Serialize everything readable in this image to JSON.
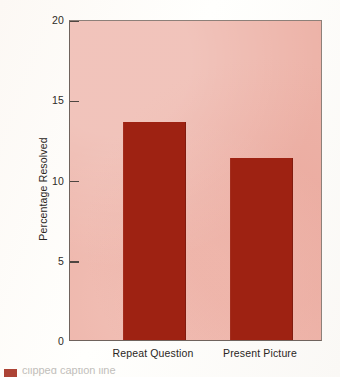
{
  "chart_data": {
    "type": "bar",
    "title": "",
    "xlabel": "",
    "ylabel": "Percentage Resolved",
    "categories": [
      "Repeat Question",
      "Present Picture"
    ],
    "values": [
      13.6,
      11.35
    ],
    "ylim": [
      0,
      20
    ],
    "yticks": [
      0,
      5,
      10,
      15,
      20
    ],
    "ytick_labels": [
      "0",
      "5",
      "10",
      "15",
      "20"
    ],
    "grid": false,
    "legend": null,
    "bar_color": "#9e2212",
    "plot_background": "#edb3a8",
    "axis_color": "#4e4641"
  },
  "caption": {
    "text": "clipped caption line"
  }
}
